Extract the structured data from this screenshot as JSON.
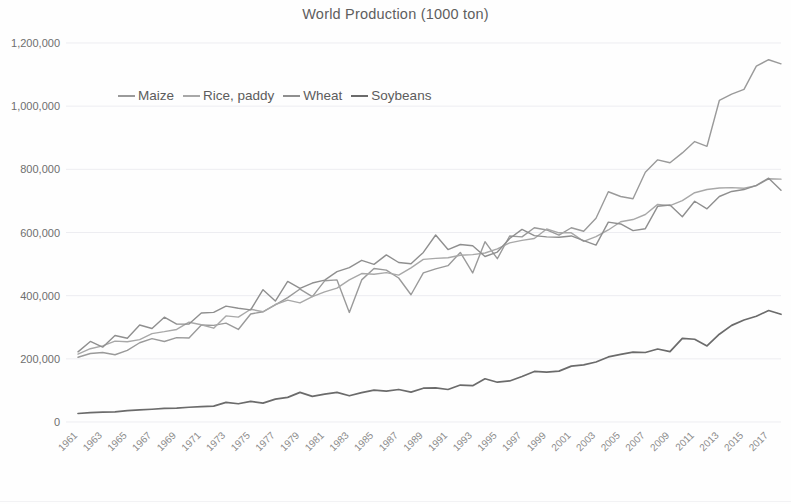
{
  "chart_data": {
    "type": "line",
    "title": "World Production (1000 ton)",
    "xlabel": "",
    "ylabel": "",
    "ylim": [
      0,
      1200000
    ],
    "ytick_values": [
      0,
      200000,
      400000,
      600000,
      800000,
      1000000,
      1200000
    ],
    "ytick_labels": [
      "0",
      "200,000",
      "400,000",
      "600,000",
      "800,000",
      "1,000,000",
      "1,200,000"
    ],
    "grid": true,
    "grid_axis": "y",
    "legend_position": "upper-left-inside",
    "x_start": 1961,
    "x_end": 2018,
    "x": [
      1961,
      1962,
      1963,
      1964,
      1965,
      1966,
      1967,
      1968,
      1969,
      1970,
      1971,
      1972,
      1973,
      1974,
      1975,
      1976,
      1977,
      1978,
      1979,
      1980,
      1981,
      1982,
      1983,
      1984,
      1985,
      1986,
      1987,
      1988,
      1989,
      1990,
      1991,
      1992,
      1993,
      1994,
      1995,
      1996,
      1997,
      1998,
      1999,
      2000,
      2001,
      2002,
      2003,
      2004,
      2005,
      2006,
      2007,
      2008,
      2009,
      2010,
      2011,
      2012,
      2013,
      2014,
      2015,
      2016,
      2017,
      2018
    ],
    "xtick_labels": [
      "1961",
      "1963",
      "1965",
      "1967",
      "1969",
      "1971",
      "1973",
      "1975",
      "1977",
      "1979",
      "1981",
      "1983",
      "1985",
      "1987",
      "1989",
      "1991",
      "1993",
      "1995",
      "1997",
      "1999",
      "2001",
      "2003",
      "2005",
      "2007",
      "2009",
      "2011",
      "2013",
      "2015",
      "2017"
    ],
    "series": [
      {
        "name": "Maize",
        "color": "#9a9a9a",
        "values": [
          205000,
          217000,
          220000,
          213000,
          227000,
          251000,
          264000,
          255000,
          267000,
          266000,
          307000,
          306000,
          313000,
          293000,
          342000,
          349000,
          371000,
          394000,
          421000,
          397000,
          447000,
          450000,
          347000,
          450000,
          486000,
          481000,
          456000,
          403000,
          472000,
          485000,
          495000,
          537000,
          472000,
          571000,
          517000,
          589000,
          586000,
          615000,
          608000,
          592000,
          615000,
          604000,
          645000,
          729000,
          714000,
          707000,
          791000,
          830000,
          821000,
          852000,
          888000,
          873000,
          1018000,
          1038000,
          1053000,
          1127000,
          1147000,
          1134000
        ]
      },
      {
        "name": "Rice, paddy",
        "color": "#a8a8a8",
        "values": [
          215000,
          232000,
          241000,
          256000,
          254000,
          261000,
          280000,
          286000,
          293000,
          316000,
          308000,
          297000,
          336000,
          332000,
          357000,
          349000,
          372000,
          386000,
          377000,
          397000,
          412000,
          424000,
          450000,
          470000,
          468000,
          473000,
          465000,
          488000,
          515000,
          518000,
          520000,
          528000,
          530000,
          535000,
          548000,
          567000,
          575000,
          581000,
          611000,
          599000,
          599000,
          572000,
          587000,
          608000,
          634000,
          641000,
          657000,
          689000,
          685000,
          701000,
          726000,
          736000,
          741000,
          742000,
          740000,
          748000,
          770000,
          769000
        ]
      },
      {
        "name": "Wheat",
        "color": "#8f8f8f",
        "values": [
          222000,
          255000,
          237000,
          274000,
          265000,
          307000,
          296000,
          332000,
          310000,
          310000,
          345000,
          347000,
          367000,
          360000,
          355000,
          419000,
          383000,
          445000,
          423000,
          440000,
          449000,
          476000,
          489000,
          512000,
          499000,
          529000,
          505000,
          501000,
          537000,
          592000,
          546000,
          562000,
          558000,
          524000,
          538000,
          581000,
          610000,
          590000,
          586000,
          585000,
          589000,
          574000,
          560000,
          633000,
          627000,
          606000,
          612000,
          683000,
          687000,
          650000,
          699000,
          675000,
          714000,
          730000,
          736000,
          749000,
          772000,
          734000
        ]
      },
      {
        "name": "Soybeans",
        "color": "#6b6b6b",
        "values": [
          26900,
          29600,
          31400,
          31900,
          36100,
          38100,
          40400,
          43100,
          44000,
          46700,
          48500,
          50400,
          62000,
          57700,
          65300,
          59600,
          72300,
          78000,
          93900,
          81000,
          88400,
          93800,
          83000,
          92900,
          101000,
          97800,
          103000,
          94600,
          107000,
          108000,
          103000,
          117000,
          115000,
          137000,
          126000,
          130000,
          144000,
          160000,
          158000,
          161000,
          177000,
          181000,
          190000,
          206000,
          214000,
          221000,
          220000,
          231000,
          223000,
          265000,
          262000,
          241000,
          278000,
          306000,
          323000,
          335000,
          353000,
          341000
        ]
      }
    ]
  },
  "legend": {
    "entries": [
      {
        "label": "Maize"
      },
      {
        "label": "Rice, paddy"
      },
      {
        "label": "Wheat"
      },
      {
        "label": "Soybeans"
      }
    ]
  }
}
